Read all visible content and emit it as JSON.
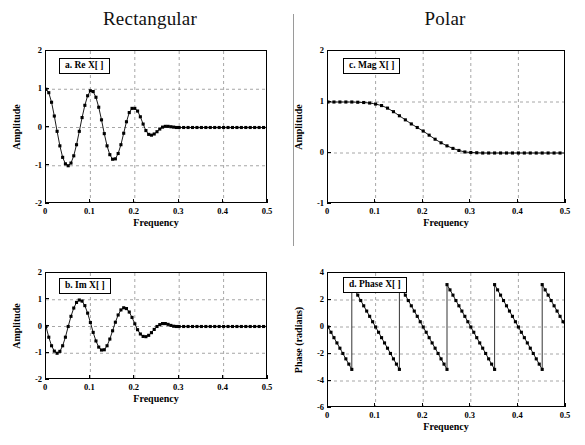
{
  "titles": {
    "left": "Rectangular",
    "right": "Polar"
  },
  "chart_data": [
    {
      "id": "panel-a",
      "type": "line",
      "label": "a.  Re X[ ]",
      "title": "",
      "xlabel": "Frequency",
      "ylabel": "Amplitude",
      "xlim": [
        0,
        0.5
      ],
      "ylim": [
        -2,
        2
      ],
      "xticks": [
        0,
        0.1,
        0.2,
        0.3,
        0.4,
        0.5
      ],
      "xticklabels": [
        "0",
        "0.1",
        "0.2",
        "0.3",
        "0.4",
        "0.5"
      ],
      "yticks": [
        -2,
        -1,
        0,
        1,
        2
      ],
      "yticklabels": [
        "-2",
        "-1",
        "0",
        "1",
        "2"
      ],
      "grid": true,
      "markers": "filled-square",
      "x": [
        0,
        0.00625,
        0.0125,
        0.01875,
        0.025,
        0.03125,
        0.0375,
        0.04375,
        0.05,
        0.05625,
        0.0625,
        0.06875,
        0.075,
        0.08125,
        0.0875,
        0.09375,
        0.1,
        0.10625,
        0.1125,
        0.11875,
        0.125,
        0.13125,
        0.1375,
        0.14375,
        0.15,
        0.15625,
        0.1625,
        0.16875,
        0.175,
        0.18125,
        0.1875,
        0.19375,
        0.2,
        0.20625,
        0.2125,
        0.21875,
        0.225,
        0.23125,
        0.2375,
        0.24375,
        0.25,
        0.25625,
        0.2625,
        0.26875,
        0.275,
        0.28125,
        0.2875,
        0.29375,
        0.3,
        0.31,
        0.32,
        0.33,
        0.34,
        0.35,
        0.36,
        0.37,
        0.38,
        0.39,
        0.4,
        0.41,
        0.42,
        0.43,
        0.44,
        0.45,
        0.46,
        0.47,
        0.48,
        0.49,
        0.5
      ],
      "y": [
        1.0,
        0.91,
        0.66,
        0.3,
        -0.1,
        -0.48,
        -0.78,
        -0.95,
        -1.0,
        -0.93,
        -0.74,
        -0.45,
        -0.1,
        0.26,
        0.58,
        0.83,
        0.96,
        0.94,
        0.79,
        0.53,
        0.2,
        -0.16,
        -0.48,
        -0.71,
        -0.83,
        -0.82,
        -0.68,
        -0.45,
        -0.15,
        0.15,
        0.39,
        0.5,
        0.5,
        0.43,
        0.28,
        0.09,
        -0.08,
        -0.18,
        -0.2,
        -0.17,
        -0.11,
        -0.04,
        0.01,
        0.03,
        0.03,
        0.02,
        0.01,
        0.0,
        0.0,
        0.0,
        0.0,
        0.0,
        0.0,
        0.0,
        0.0,
        0.0,
        0.0,
        0.0,
        0.0,
        0.0,
        0.0,
        0.0,
        0.0,
        0.0,
        0.0,
        0.0,
        0.0,
        0.0,
        0.0
      ]
    },
    {
      "id": "panel-b",
      "type": "line",
      "label": "b.  Im X[ ]",
      "title": "",
      "xlabel": "Frequency",
      "ylabel": "Amplitude",
      "xlim": [
        0,
        0.5
      ],
      "ylim": [
        -2,
        2
      ],
      "xticks": [
        0,
        0.1,
        0.2,
        0.3,
        0.4,
        0.5
      ],
      "xticklabels": [
        "0",
        "0.1",
        "0.2",
        "0.3",
        "0.4",
        "0.5"
      ],
      "yticks": [
        -2,
        -1,
        0,
        1,
        2
      ],
      "yticklabels": [
        "-2",
        "-1",
        "0",
        "1",
        "2"
      ],
      "grid": true,
      "markers": "filled-square",
      "x": [
        0,
        0.00625,
        0.0125,
        0.01875,
        0.025,
        0.03125,
        0.0375,
        0.04375,
        0.05,
        0.05625,
        0.0625,
        0.06875,
        0.075,
        0.08125,
        0.0875,
        0.09375,
        0.1,
        0.10625,
        0.1125,
        0.11875,
        0.125,
        0.13125,
        0.1375,
        0.14375,
        0.15,
        0.15625,
        0.1625,
        0.16875,
        0.175,
        0.18125,
        0.1875,
        0.19375,
        0.2,
        0.20625,
        0.2125,
        0.21875,
        0.225,
        0.23125,
        0.2375,
        0.24375,
        0.25,
        0.25625,
        0.2625,
        0.26875,
        0.275,
        0.28125,
        0.2875,
        0.29375,
        0.3,
        0.31,
        0.32,
        0.33,
        0.34,
        0.35,
        0.36,
        0.37,
        0.38,
        0.39,
        0.4,
        0.41,
        0.42,
        0.43,
        0.44,
        0.45,
        0.46,
        0.47,
        0.48,
        0.49,
        0.5
      ],
      "y": [
        0.0,
        -0.4,
        -0.72,
        -0.92,
        -1.0,
        -0.93,
        -0.72,
        -0.4,
        0.0,
        0.38,
        0.69,
        0.9,
        0.99,
        0.95,
        0.78,
        0.5,
        0.15,
        -0.22,
        -0.54,
        -0.77,
        -0.88,
        -0.87,
        -0.72,
        -0.47,
        -0.16,
        0.16,
        0.43,
        0.62,
        0.7,
        0.67,
        0.54,
        0.34,
        0.1,
        -0.12,
        -0.28,
        -0.37,
        -0.38,
        -0.33,
        -0.23,
        -0.11,
        0.0,
        0.07,
        0.11,
        0.11,
        0.08,
        0.04,
        0.01,
        0.0,
        0.0,
        0.0,
        0.0,
        0.0,
        0.0,
        0.0,
        0.0,
        0.0,
        0.0,
        0.0,
        0.0,
        0.0,
        0.0,
        0.0,
        0.0,
        0.0,
        0.0,
        0.0,
        0.0,
        0.0,
        0.0
      ]
    },
    {
      "id": "panel-c",
      "type": "line",
      "label": "c.  Mag X[ ]",
      "title": "",
      "xlabel": "Frequency",
      "ylabel": "Amplitude",
      "xlim": [
        0,
        0.5
      ],
      "ylim": [
        -1,
        2
      ],
      "xticks": [
        0,
        0.1,
        0.2,
        0.3,
        0.4,
        0.5
      ],
      "xticklabels": [
        "0",
        "0.1",
        "0.2",
        "0.3",
        "0.4",
        "0.5"
      ],
      "yticks": [
        -1,
        0,
        1,
        2
      ],
      "yticklabels": [
        "-1",
        "0",
        "1",
        "2"
      ],
      "grid": true,
      "markers": "filled-square",
      "x": [
        0,
        0.0125,
        0.025,
        0.0375,
        0.05,
        0.0625,
        0.075,
        0.0875,
        0.1,
        0.1125,
        0.125,
        0.1375,
        0.15,
        0.1625,
        0.175,
        0.1875,
        0.2,
        0.2125,
        0.225,
        0.2375,
        0.25,
        0.2625,
        0.275,
        0.2875,
        0.3,
        0.3125,
        0.325,
        0.3375,
        0.35,
        0.3625,
        0.375,
        0.3875,
        0.4,
        0.4125,
        0.425,
        0.4375,
        0.45,
        0.4625,
        0.475,
        0.4875,
        0.5
      ],
      "y": [
        1.0,
        1.0,
        1.0,
        1.0,
        1.0,
        0.995,
        0.99,
        0.98,
        0.96,
        0.93,
        0.88,
        0.81,
        0.73,
        0.65,
        0.57,
        0.5,
        0.43,
        0.35,
        0.27,
        0.2,
        0.14,
        0.09,
        0.05,
        0.02,
        0.01,
        0.005,
        0.0,
        0.0,
        0.0,
        0.0,
        0.0,
        0.0,
        0.0,
        0.0,
        0.0,
        0.0,
        0.0,
        0.0,
        0.0,
        0.0,
        0.0
      ]
    },
    {
      "id": "panel-d",
      "type": "line",
      "label": "d.  Phase X[ ]",
      "title": "",
      "xlabel": "Frequency",
      "ylabel": "Phase (radians)",
      "xlim": [
        0,
        0.5
      ],
      "ylim": [
        -6,
        4
      ],
      "xticks": [
        0,
        0.1,
        0.2,
        0.3,
        0.4,
        0.5
      ],
      "xticklabels": [
        "0",
        "0.1",
        "0.2",
        "0.3",
        "0.4",
        "0.5"
      ],
      "yticks": [
        -6,
        -4,
        -2,
        0,
        2,
        4
      ],
      "yticklabels": [
        "-6",
        "-4",
        "-2",
        "0",
        "2",
        "4"
      ],
      "grid": true,
      "markers": "filled-square",
      "wrap_points": [
        0.05,
        0.15,
        0.25,
        0.35,
        0.45
      ],
      "segments": [
        {
          "x": [
            0,
            0.00625,
            0.0125,
            0.01875,
            0.025,
            0.03125,
            0.0375,
            0.04375,
            0.05
          ],
          "y": [
            0,
            -0.39,
            -0.79,
            -1.18,
            -1.57,
            -1.96,
            -2.36,
            -2.75,
            -3.14
          ]
        },
        {
          "x": [
            0.05,
            0.05625,
            0.0625,
            0.06875,
            0.075,
            0.08125,
            0.0875,
            0.09375,
            0.1,
            0.10625,
            0.1125,
            0.11875,
            0.125,
            0.13125,
            0.1375,
            0.14375,
            0.15
          ],
          "y": [
            3.14,
            2.75,
            2.36,
            1.96,
            1.57,
            1.18,
            0.79,
            0.39,
            0,
            -0.39,
            -0.79,
            -1.18,
            -1.57,
            -1.96,
            -2.36,
            -2.75,
            -3.14
          ]
        },
        {
          "x": [
            0.15,
            0.15625,
            0.1625,
            0.16875,
            0.175,
            0.18125,
            0.1875,
            0.19375,
            0.2,
            0.20625,
            0.2125,
            0.21875,
            0.225,
            0.23125,
            0.2375,
            0.24375,
            0.25
          ],
          "y": [
            3.14,
            2.75,
            2.36,
            1.96,
            1.57,
            1.18,
            0.79,
            0.39,
            0,
            -0.39,
            -0.79,
            -1.18,
            -1.57,
            -1.96,
            -2.36,
            -2.75,
            -3.14
          ]
        },
        {
          "x": [
            0.25,
            0.25625,
            0.2625,
            0.26875,
            0.275,
            0.28125,
            0.2875,
            0.29375,
            0.3,
            0.30625,
            0.3125,
            0.31875,
            0.325,
            0.33125,
            0.3375,
            0.34375,
            0.35
          ],
          "y": [
            3.14,
            2.75,
            2.36,
            1.96,
            1.57,
            1.18,
            0.79,
            0.39,
            0,
            -0.39,
            -0.79,
            -1.18,
            -1.57,
            -1.96,
            -2.36,
            -2.75,
            -3.14
          ]
        },
        {
          "x": [
            0.35,
            0.35625,
            0.3625,
            0.36875,
            0.375,
            0.38125,
            0.3875,
            0.39375,
            0.4,
            0.40625,
            0.4125,
            0.41875,
            0.425,
            0.43125,
            0.4375,
            0.44375,
            0.45
          ],
          "y": [
            3.14,
            2.75,
            2.36,
            1.96,
            1.57,
            1.18,
            0.79,
            0.39,
            0,
            -0.39,
            -0.79,
            -1.18,
            -1.57,
            -1.96,
            -2.36,
            -2.75,
            -3.14
          ]
        },
        {
          "x": [
            0.45,
            0.45625,
            0.4625,
            0.46875,
            0.475,
            0.48125,
            0.4875,
            0.49375,
            0.5
          ],
          "y": [
            3.14,
            2.75,
            2.36,
            1.96,
            1.57,
            1.18,
            0.79,
            0.39,
            0
          ]
        }
      ]
    }
  ],
  "style": {
    "line_color": "#000000",
    "marker_color": "#000000",
    "grid_color": "#8f8f8f",
    "axis_color": "#000000",
    "background": "#ffffff"
  }
}
